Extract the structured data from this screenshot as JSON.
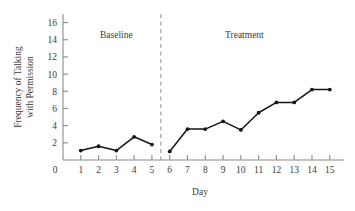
{
  "chart_data": {
    "type": "line",
    "title": "",
    "xlabel": "Day",
    "ylabel": "Frequency of Talking with Permission",
    "ylabel_line1": "Frequency of Talking",
    "ylabel_line2": "with Permission",
    "x": [
      1,
      2,
      3,
      4,
      5,
      6,
      7,
      8,
      9,
      10,
      11,
      12,
      13,
      14,
      15
    ],
    "values": [
      1.1,
      1.6,
      1.1,
      2.7,
      1.8,
      1.0,
      3.6,
      3.6,
      4.5,
      3.5,
      5.5,
      6.7,
      6.7,
      8.2,
      8.2
    ],
    "series": [
      {
        "name": "Frequency of Talking with Permission",
        "values": [
          1.1,
          1.6,
          1.1,
          2.7,
          1.8,
          1.0,
          3.6,
          3.6,
          4.5,
          3.5,
          5.5,
          6.7,
          6.7,
          8.2,
          8.2
        ]
      }
    ],
    "xlim": [
      0,
      15.8
    ],
    "ylim": [
      0,
      17
    ],
    "x_tick_labels": [
      "1",
      "2",
      "3",
      "4",
      "5",
      "6",
      "7",
      "8",
      "9",
      "10",
      "11",
      "12",
      "13",
      "14",
      "15"
    ],
    "y_ticks": [
      2,
      4,
      6,
      8,
      10,
      12,
      14,
      16
    ],
    "y_tick_labels": [
      "2",
      "4",
      "6",
      "8",
      "10",
      "12",
      "14",
      "16"
    ],
    "origin_label": "0",
    "grid": false,
    "legend": "none",
    "marker": "filled-circle",
    "line_color": "#151515",
    "axis_color": "#8a8a8a",
    "phases": [
      {
        "label": "Baseline",
        "x_start": 1,
        "x_end": 5,
        "label_x": 3,
        "label_y": 14.2
      },
      {
        "label": "Treatment",
        "x_start": 6,
        "x_end": 15,
        "label_x": 10.2,
        "label_y": 14.2
      }
    ],
    "phase_divider": {
      "x": 5.5,
      "style": "dashed",
      "color": "#9a9a9a"
    },
    "annotations": []
  }
}
